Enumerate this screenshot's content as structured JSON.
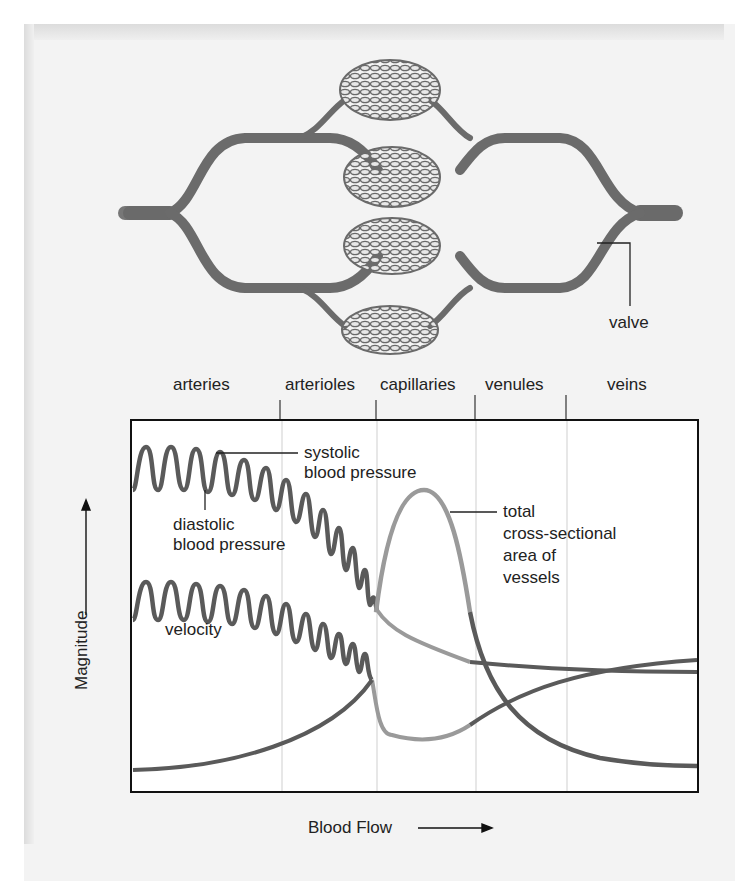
{
  "diagram": {
    "illustration": {
      "description": "Capillary beds connecting an artery (left) to a vein (right)",
      "callouts": {
        "valve": "valve"
      }
    },
    "regions": [
      "arteries",
      "arterioles",
      "capillaries",
      "venules",
      "veins"
    ],
    "axes": {
      "x_label": "Blood Flow",
      "y_label": "Magnitude"
    },
    "curves": {
      "systolic": "systolic\nblood pressure",
      "systolic_line1": "systolic",
      "systolic_line2": "blood pressure",
      "diastolic_line1": "diastolic",
      "diastolic_line2": "blood pressure",
      "velocity": "velocity",
      "area_line1": "total",
      "area_line2": "cross-sectional",
      "area_line3": "area of",
      "area_line4": "vessels"
    },
    "colors": {
      "curve_dark": "#5a5a5a",
      "curve_light": "#9a9a9a",
      "vessel": "#6e6e6e",
      "frame": "#111111"
    }
  }
}
